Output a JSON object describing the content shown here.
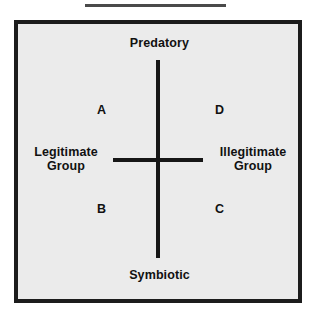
{
  "figure": {
    "title_rule": "horizontal-rule",
    "background_color": "#ebebeb",
    "frame_color": "#1c1c1c",
    "axis_color": "#161616",
    "text_color": "#111111"
  },
  "axes": {
    "vertical": {
      "top_label": "Predatory",
      "bottom_label": "Symbiotic"
    },
    "horizontal": {
      "left_label_line1": "Legitimate",
      "left_label_line2": "Group",
      "right_label_line1": "Illegitimate",
      "right_label_line2": "Group"
    }
  },
  "quadrants": [
    {
      "id": "a",
      "label": "A",
      "position": "top-left"
    },
    {
      "id": "d",
      "label": "D",
      "position": "top-right"
    },
    {
      "id": "b",
      "label": "B",
      "position": "bottom-left"
    },
    {
      "id": "c",
      "label": "C",
      "position": "bottom-right"
    }
  ],
  "chart_data": {
    "type": "scatter",
    "title": "",
    "xlabel": "Legitimate Group — Illegitimate Group",
    "ylabel": "Symbiotic — Predatory",
    "x_axis_left_label": "Legitimate Group",
    "x_axis_right_label": "Illegitimate Group",
    "y_axis_top_label": "Predatory",
    "y_axis_bottom_label": "Symbiotic",
    "grid": false,
    "legend": "none",
    "annotations": [
      {
        "text": "A",
        "quadrant": "top-left",
        "x": -0.5,
        "y": 0.55
      },
      {
        "text": "D",
        "quadrant": "top-right",
        "x": 0.5,
        "y": 0.55
      },
      {
        "text": "B",
        "quadrant": "bottom-left",
        "x": -0.5,
        "y": -0.45
      },
      {
        "text": "C",
        "quadrant": "bottom-right",
        "x": 0.5,
        "y": -0.45
      }
    ],
    "xlim": [
      -1,
      1
    ],
    "ylim": [
      -1,
      1
    ]
  }
}
